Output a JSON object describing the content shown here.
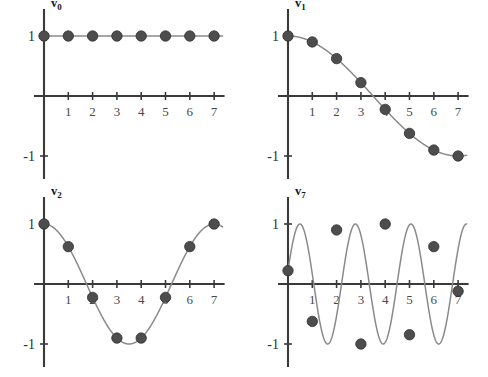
{
  "figure": {
    "title": "",
    "background_color": "#ffffff",
    "marker_color": "#4d4d4d",
    "curve_color": "#8a8a8a",
    "axis_color": "#3a3a3a",
    "rows": 2,
    "cols": 2
  },
  "chart_data": [
    {
      "type": "line",
      "title": "v0",
      "title_base": "v",
      "title_sub": "0",
      "xlabel": "",
      "ylabel": "",
      "xlim": [
        0,
        7.35
      ],
      "ylim": [
        -1.25,
        1.25
      ],
      "grid": false,
      "legend": "none",
      "xticks": [
        1,
        2,
        3,
        4,
        5,
        6,
        7
      ],
      "xticklabels": [
        "1",
        "2",
        "3",
        "4",
        "5",
        "6",
        "7"
      ],
      "yticks": [
        1,
        -1
      ],
      "yticklabels": [
        "1",
        "-1"
      ],
      "x": [
        0,
        1,
        2,
        3,
        4,
        5,
        6,
        7
      ],
      "values": [
        1,
        1,
        1,
        1,
        1,
        1,
        1,
        1
      ],
      "curve_expression": "cos(0 * pi * t / 7)",
      "markers": true
    },
    {
      "type": "line",
      "title": "v1",
      "title_base": "v",
      "title_sub": "1",
      "xlabel": "",
      "ylabel": "",
      "xlim": [
        0,
        7.35
      ],
      "ylim": [
        -1.25,
        1.25
      ],
      "grid": false,
      "legend": "none",
      "xticks": [
        1,
        2,
        3,
        4,
        5,
        6,
        7
      ],
      "xticklabels": [
        "1",
        "2",
        "3",
        "4",
        "5",
        "6",
        "7"
      ],
      "yticks": [
        1,
        -1
      ],
      "yticklabels": [
        "1",
        "-1"
      ],
      "x": [
        0,
        1,
        2,
        3,
        4,
        5,
        6,
        7
      ],
      "values": [
        1,
        0.901,
        0.623,
        0.223,
        -0.223,
        -0.623,
        -0.901,
        -1
      ],
      "curve_expression": "cos(1 * pi * t / 7)",
      "markers": true
    },
    {
      "type": "line",
      "title": "v2",
      "title_base": "v",
      "title_sub": "2",
      "xlabel": "",
      "ylabel": "",
      "xlim": [
        0,
        7.35
      ],
      "ylim": [
        -1.25,
        1.25
      ],
      "grid": false,
      "legend": "none",
      "xticks": [
        1,
        2,
        3,
        4,
        5,
        6,
        7
      ],
      "xticklabels": [
        "1",
        "2",
        "3",
        "4",
        "5",
        "6",
        "7"
      ],
      "yticks": [
        1,
        -1
      ],
      "yticklabels": [
        "1",
        "-1"
      ],
      "x": [
        0,
        1,
        2,
        3,
        4,
        5,
        6,
        7
      ],
      "values": [
        1,
        0.623,
        -0.223,
        -0.901,
        -0.901,
        -0.223,
        0.623,
        1
      ],
      "curve_expression": "cos(2 * pi * t / 7)",
      "markers": true
    },
    {
      "type": "line",
      "title": "v7",
      "title_base": "v",
      "title_sub": "7",
      "xlabel": "",
      "ylabel": "",
      "xlim": [
        0,
        7.35
      ],
      "ylim": [
        -1.25,
        1.25
      ],
      "grid": false,
      "legend": "none",
      "xticks": [
        1,
        2,
        3,
        4,
        5,
        6,
        7
      ],
      "xticklabels": [
        "1",
        "2",
        "3",
        "4",
        "5",
        "6",
        "7"
      ],
      "yticks": [
        1,
        -1
      ],
      "yticklabels": [
        "1",
        "-1"
      ],
      "x": [
        0,
        1,
        2,
        3,
        4,
        5,
        6,
        7
      ],
      "values": [
        0.223,
        -0.623,
        0.901,
        -1,
        1,
        -0.845,
        0.623,
        -0.12
      ],
      "curve_expression": "cos(7 * pi * t / 8 + 0.35)",
      "markers": true
    }
  ]
}
